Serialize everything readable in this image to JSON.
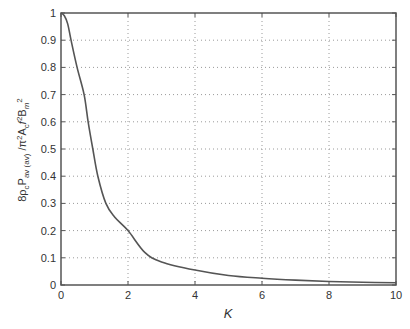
{
  "chart_data": {
    "type": "line",
    "title": "",
    "xlabel": "K",
    "ylabel": "8ρcPav(av)/π²Acf²Bm²",
    "ylabel_parts": {
      "base": "8ρ",
      "sub1": "c",
      "mid1": "P",
      "sub2": "av (av)",
      "mid2": " /π",
      "sup1": "2",
      "mid3": "A",
      "sub3": "c",
      "mid4": "f",
      "sup2": "2",
      "mid5": "B",
      "sub4": "m",
      "sup3": "2"
    },
    "xlim": [
      0,
      10
    ],
    "ylim": [
      0,
      1
    ],
    "xticks": [
      "0",
      "2",
      "4",
      "6",
      "8",
      "10"
    ],
    "yticks": [
      "0",
      "0.1",
      "0.2",
      "0.3",
      "0.4",
      "0.5",
      "0.6",
      "0.7",
      "0.8",
      "0.9",
      "1"
    ],
    "grid": true,
    "legend": null,
    "series": [
      {
        "name": "normalized power loss",
        "color": "#555555",
        "x": [
          0,
          0.1,
          0.2,
          0.3,
          0.48,
          0.69,
          0.81,
          0.95,
          1.1,
          1.34,
          1.6,
          2.0,
          2.5,
          3.0,
          4.0,
          5.0,
          6.0,
          7.0,
          8.0,
          9.0,
          10.0
        ],
        "y": [
          1.0,
          0.99,
          0.96,
          0.9,
          0.8,
          0.7,
          0.6,
          0.5,
          0.4,
          0.3,
          0.25,
          0.2,
          0.12,
          0.085,
          0.055,
          0.035,
          0.025,
          0.018,
          0.013,
          0.01,
          0.008
        ]
      }
    ]
  },
  "colors": {
    "axis": "#555555",
    "grid": "#9a9a9a",
    "line": "#555555"
  }
}
